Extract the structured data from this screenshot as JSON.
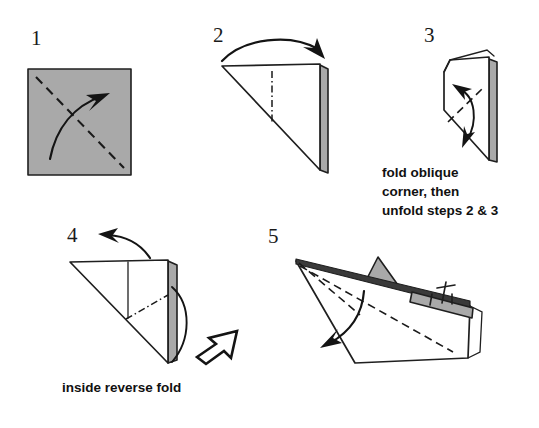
{
  "figure": {
    "background_color": "#ffffff",
    "paper_front_color": "#ffffff",
    "paper_back_color": "#a9a9a9",
    "line_color": "#1f1f1f",
    "width": 539,
    "height": 428
  },
  "steps": [
    {
      "number": "1",
      "name": "square-diagonal-fold",
      "shape": "gray square",
      "fold_line": "dashed diagonal from top-left to bottom-right",
      "arrow": "curved arrow pointing up-right"
    },
    {
      "number": "2",
      "name": "triangle-fold-over",
      "shape": "white triangle with gray back layer at right",
      "fold_line": "vertical dash-dot center line",
      "arrow": "curved arrow arcing left to right over the top"
    },
    {
      "number": "3",
      "name": "oblique-corner-fold",
      "shape": "narrow folded sheet with gray back layer at right",
      "fold_line": "oblique dashed line",
      "arrow": "double-headed curved arrow (fold and unfold)"
    },
    {
      "number": "4",
      "name": "inside-reverse-fold",
      "shape": "white triangle with gray back layer at right",
      "fold_line": "vertical line plus oblique dash-dot line",
      "arrow": "curved arrow to upper-left and hollow push arrow at lower-right"
    },
    {
      "number": "5",
      "name": "finished-boat",
      "shape": "paper boat with gray sail",
      "fold_line": "dashed diagonal across hull",
      "arrow": "curved arrow pointing down-left"
    }
  ],
  "captions": [
    {
      "name": "caption-step-3",
      "lines": [
        "fold oblique",
        "corner, then",
        "unfold steps 2 & 3"
      ]
    },
    {
      "name": "caption-step-4",
      "lines": [
        "inside reverse fold"
      ]
    }
  ],
  "labels": {
    "step1": "1",
    "step2": "2",
    "step3": "3",
    "step4": "4",
    "step5": "5",
    "caption3_line1": "fold oblique",
    "caption3_line2": "corner, then",
    "caption3_line3": "unfold steps 2 & 3",
    "caption4_line1": "inside reverse fold"
  }
}
